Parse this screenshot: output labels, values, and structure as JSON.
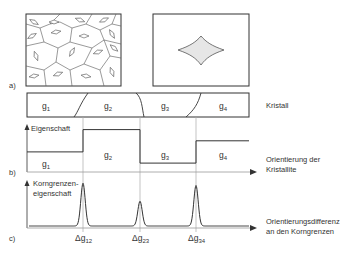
{
  "panel_labels": {
    "a": "a)",
    "b": "b)",
    "c": "c)"
  },
  "crystal": {
    "label": "Kristall",
    "grains": [
      {
        "name": "g",
        "sub": "1"
      },
      {
        "name": "g",
        "sub": "2"
      },
      {
        "name": "g",
        "sub": "3"
      },
      {
        "name": "g",
        "sub": "4"
      }
    ]
  },
  "property_plot": {
    "y_label": "Eigenschaft",
    "x_label_line1": "Orientierung der",
    "x_label_line2": "Kristallite",
    "step_levels": [
      0.45,
      0.95,
      0.2,
      0.7
    ]
  },
  "boundary_plot": {
    "y_label_line1": "Korngrenzen-",
    "y_label_line2": "eigenschaft",
    "x_label_line1": "Orientierungsdifferenz",
    "x_label_line2": "an den Korngrenzen",
    "peaks": [
      {
        "label": "Δg",
        "sub": "12",
        "height": 0.95
      },
      {
        "label": "Δg",
        "sub": "23",
        "height": 0.55
      },
      {
        "label": "Δg",
        "sub": "34",
        "height": 0.9
      }
    ]
  },
  "colors": {
    "line": "#333333",
    "grid": "#aaaaaa",
    "fill": "#e6e6e6"
  }
}
